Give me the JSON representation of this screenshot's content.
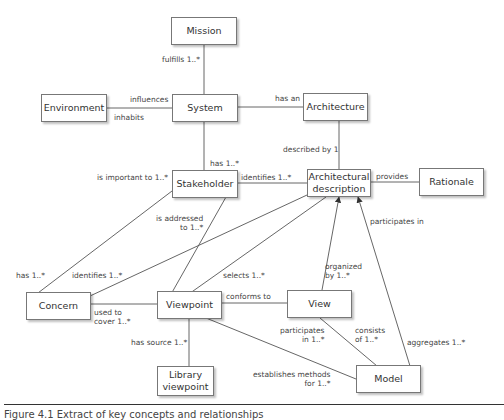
{
  "nodes": {
    "mission": "Mission",
    "environment": "Environment",
    "system": "System",
    "architecture": "Architecture",
    "stakeholder": "Stakeholder",
    "architectural_description": "Architectural description",
    "rationale": "Rationale",
    "concern": "Concern",
    "viewpoint": "Viewpoint",
    "view": "View",
    "library_viewpoint": "Library viewpoint",
    "model": "Model"
  },
  "relationships": {
    "fulfills": "fulfills 1..*",
    "influences": "influences",
    "inhabits": "inhabits",
    "has_an": "has an",
    "has_stakeholder": "has 1..*",
    "described_by": "described by 1",
    "is_important_to": "is important to 1..*",
    "identifies_stakeholder": "identifies 1..*",
    "provides": "provides",
    "is_addressed_to_1": "is addressed",
    "is_addressed_to_2": "to 1..*",
    "participates_in": "participates in",
    "has_concern": "has 1..*",
    "identifies_concern": "identifies 1..*",
    "selects": "selects 1..*",
    "organized_by_1": "organized",
    "organized_by_2": "by 1..*",
    "conforms_to": "conforms to",
    "used_to_cover_1": "used to",
    "used_to_cover_2": "cover 1..*",
    "has_source": "has source 1..*",
    "view_participates_1": "participates",
    "view_participates_2": "in 1..*",
    "consists_of_1": "consists",
    "consists_of_2": "of 1..*",
    "aggregates": "aggregates 1..*",
    "establishes_1": "establishes methods",
    "establishes_2": "for 1..*"
  },
  "caption": "Figure 4.1   Extract of key concepts and relationships"
}
